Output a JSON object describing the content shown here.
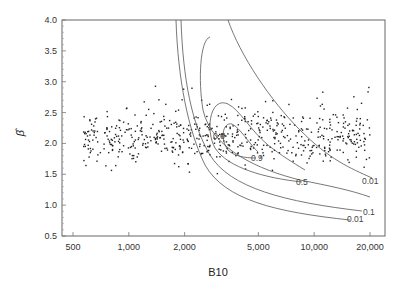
{
  "chart_data": {
    "type": "scatter",
    "title": "",
    "xlabel": "B10",
    "ylabel": "β̂",
    "xscale": "log",
    "xlim": [
      440,
      24000
    ],
    "ylim": [
      0.5,
      4.0
    ],
    "x_ticks": [
      {
        "value": 500,
        "label": "500"
      },
      {
        "value": 1000,
        "label": "1,000"
      },
      {
        "value": 2000,
        "label": "2,000"
      },
      {
        "value": 5000,
        "label": "5,000"
      },
      {
        "value": 10000,
        "label": "10,000"
      },
      {
        "value": 20000,
        "label": "20,000"
      }
    ],
    "y_ticks": [
      {
        "value": 0.5,
        "label": "0.5"
      },
      {
        "value": 1.0,
        "label": "1.0"
      },
      {
        "value": 1.5,
        "label": "1.5"
      },
      {
        "value": 2.0,
        "label": "2.0"
      },
      {
        "value": 2.5,
        "label": "2.5"
      },
      {
        "value": 3.0,
        "label": "3.0"
      },
      {
        "value": 3.5,
        "label": "3.5"
      },
      {
        "value": 4.0,
        "label": "4.0"
      }
    ],
    "grid": false,
    "legend": null,
    "series": [
      {
        "name": "simulated estimates",
        "kind": "scatter",
        "description": "~600 points spread over B10 from ~550 to ~20,000, beta-hat mostly between 1.6 and 2.6, centered near 2.1",
        "beta_range": [
          1.5,
          2.95
        ],
        "beta_center": 2.1,
        "b10_range": [
          550,
          20000
        ]
      }
    ],
    "contours": [
      {
        "level": "0.01",
        "label": "0.01"
      },
      {
        "level": "0.1",
        "label": "0.1"
      },
      {
        "level": "0.5",
        "label": "0.5"
      },
      {
        "level": "0.6",
        "label": "0.6"
      },
      {
        "level": "0.9",
        "label": "0.9"
      }
    ],
    "annotations": [
      "0.01",
      "0.1",
      "0.5",
      "0.6",
      "0.9",
      "0.01"
    ]
  }
}
